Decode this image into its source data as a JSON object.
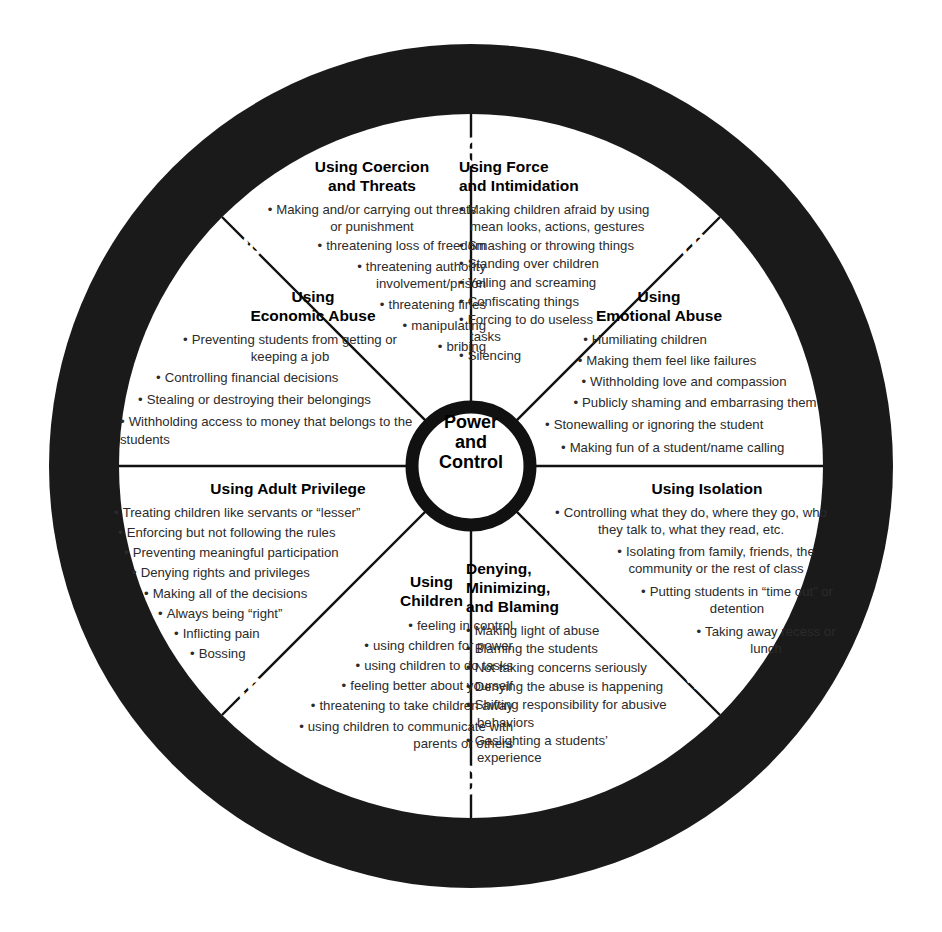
{
  "diagram": {
    "hub": {
      "line1": "Power",
      "line2": "and",
      "line3": "Control"
    },
    "colors": {
      "ring": "#1a1a1a",
      "ring_text": "#ffffff",
      "spoke": "#111111",
      "body_text": "#2b2b2b",
      "heading_text": "#000000",
      "background": "#ffffff"
    },
    "outer_ring_labels": [
      {
        "text": "Violence",
        "position": "top",
        "size": "big"
      },
      {
        "text": "Physical",
        "position": "top-left",
        "size": "mid"
      },
      {
        "text": "Sexual",
        "position": "top-right",
        "size": "mid"
      },
      {
        "text": "Emotional",
        "position": "left",
        "size": "mid"
      },
      {
        "text": "Emotional",
        "position": "right",
        "size": "mid"
      },
      {
        "text": "Sexual",
        "position": "bottom-left",
        "size": "mid"
      },
      {
        "text": "Physical",
        "position": "bottom-right",
        "size": "mid"
      },
      {
        "text": "Violence",
        "position": "bottom",
        "size": "big"
      }
    ],
    "sectors": [
      {
        "id": "coercion",
        "title": "Using Coercion\nand Threats",
        "title_lines": [
          "Using Coercion",
          "and Threats"
        ],
        "items": [
          "Making and/or carrying out threats or punishment",
          "threatening loss of freedom",
          "threatening authority involvement/prison",
          "threatening fines",
          "manipulating",
          "bribing"
        ]
      },
      {
        "id": "force",
        "title": "Using Force\nand Intimidation",
        "title_lines": [
          "Using Force",
          "and Intimidation"
        ],
        "items": [
          "Making children afraid by using mean looks, actions, gestures",
          "Smashing or throwing things",
          "Standing over children",
          "Yelling and screaming",
          "Confiscating things",
          "Forcing to do useless tasks",
          "Silencing"
        ]
      },
      {
        "id": "economic",
        "title": "Using\nEconomic Abuse",
        "title_lines": [
          "Using",
          "Economic Abuse"
        ],
        "items": [
          "Preventing students from getting or keeping a job",
          "Controlling financial decisions",
          "Stealing or destroying their belongings",
          "Withholding access to money that belongs to the students"
        ]
      },
      {
        "id": "emotional-abuse",
        "title": "Using\nEmotional Abuse",
        "title_lines": [
          "Using",
          "Emotional Abuse"
        ],
        "items": [
          "Humiliating children",
          "Making them feel like failures",
          "Withholding love and compassion",
          "Publicly shaming and embarrasing them",
          "Stonewalling or ignoring the student",
          "Making fun of a student/name calling"
        ]
      },
      {
        "id": "adult-privilege",
        "title": "Using Adult Privilege",
        "title_lines": [
          "Using Adult Privilege"
        ],
        "items": [
          "Treating children like servants or “lesser”",
          "Enforcing but not following the rules",
          "Preventing meaningful participation",
          "Denying rights and privileges",
          "Making all of the decisions",
          "Always being “right”",
          "Inflicting pain",
          "Bossing"
        ]
      },
      {
        "id": "isolation",
        "title": "Using Isolation",
        "title_lines": [
          "Using Isolation"
        ],
        "items": [
          "Controlling what they do, where they go, who they talk to, what they read, etc.",
          "Isolating from family, friends, the community or the rest of class",
          "Putting students in “time out” or detention",
          "Taking away recess or lunch"
        ]
      },
      {
        "id": "children",
        "title": "Using\nChildren",
        "title_lines": [
          "Using",
          "Children"
        ],
        "items": [
          "feeling in control",
          "using children for power",
          "using children to do tasks",
          "feeling better about yourself",
          "threatening to take children away",
          "using children to communicate with parents or others"
        ]
      },
      {
        "id": "denying",
        "title": "Denying,\nMinimizing,\nand Blaming",
        "title_lines": [
          "Denying,",
          "Minimizing,",
          "and Blaming"
        ],
        "items": [
          "Making light of abuse",
          "Blaming the students",
          "Not taking concerns seriously",
          "Denying the abuse is happening",
          "Shifting responsibility for abusive behaviors",
          "Gaslighting a students’ experience"
        ]
      }
    ]
  }
}
